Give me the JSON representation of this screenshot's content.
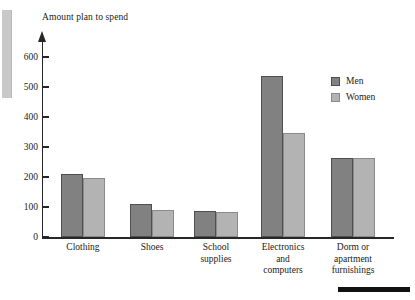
{
  "chart_data": {
    "type": "bar",
    "title": "",
    "ylabel": "Amount plan to spend",
    "xlabel": "",
    "categories": [
      "Clothing",
      "Shoes",
      "School\nsupplies",
      "Electronics\nand\ncomputers",
      "Dorm or\napartment\nfurnishings"
    ],
    "series": [
      {
        "name": "Men",
        "color": "#818181",
        "values": [
          210,
          110,
          87,
          538,
          265
        ]
      },
      {
        "name": "Women",
        "color": "#b3b3b3",
        "values": [
          197,
          90,
          83,
          348,
          264
        ]
      }
    ],
    "ylim": [
      0,
      600
    ],
    "yticks": [
      0,
      100,
      200,
      300,
      400,
      500,
      600
    ],
    "ytick_labels": [
      "0",
      "100",
      "200",
      "300",
      "400",
      "500",
      "600"
    ],
    "grid": false,
    "legend_position": "upper right",
    "axis_arrow": true
  },
  "legend": {
    "items": [
      {
        "label": "Men"
      },
      {
        "label": "Women"
      }
    ]
  },
  "footer": {
    "rule": ""
  }
}
